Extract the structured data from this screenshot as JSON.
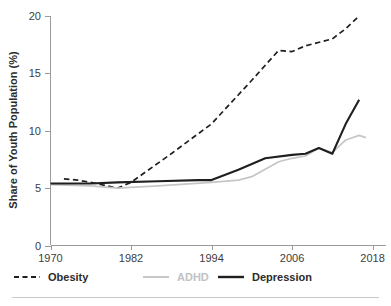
{
  "chart_data": {
    "type": "line",
    "title": "",
    "xlabel": "",
    "ylabel": "Share of Youth Population (%)",
    "xlim": [
      1970,
      2020
    ],
    "ylim": [
      0,
      20
    ],
    "xticks": [
      1970,
      1982,
      1994,
      2006,
      2018
    ],
    "xticklabels": [
      "1970",
      "1982",
      "1994",
      "2006",
      "2018"
    ],
    "yticks": [
      0,
      5,
      10,
      15,
      20
    ],
    "yticklabels": [
      "0",
      "5",
      "10",
      "15",
      "20"
    ],
    "grid": false,
    "legend_position": "below-axes",
    "series": [
      {
        "name": "Obesity",
        "color": "#1f1f1f",
        "style": "dashed",
        "width": 1.7,
        "x": [
          1972,
          1974,
          1976,
          1980,
          1982,
          1988,
          1994,
          2000,
          2004,
          2006,
          2008,
          2012,
          2014,
          2016
        ],
        "values": [
          5.8,
          5.7,
          5.5,
          5.0,
          5.5,
          8.0,
          10.6,
          14.4,
          17.0,
          16.9,
          17.4,
          18.0,
          18.9,
          20.0
        ]
      },
      {
        "name": "ADHD",
        "color": "#c6c6c6",
        "style": "solid",
        "width": 1.7,
        "x": [
          1970,
          1976,
          1980,
          1986,
          1994,
          1998,
          2000,
          2004,
          2006,
          2008,
          2010,
          2012,
          2014,
          2016,
          2017
        ],
        "values": [
          5.3,
          5.2,
          5.0,
          5.2,
          5.5,
          5.7,
          6.0,
          7.3,
          7.6,
          7.8,
          8.5,
          8.1,
          9.2,
          9.6,
          9.4
        ]
      },
      {
        "name": "Depression",
        "color": "#1f1f1f",
        "style": "solid",
        "width": 2.1,
        "x": [
          1970,
          1976,
          1980,
          1986,
          1992,
          1994,
          1998,
          2002,
          2006,
          2008,
          2010,
          2012,
          2014,
          2016
        ],
        "values": [
          5.4,
          5.4,
          5.5,
          5.6,
          5.7,
          5.7,
          6.6,
          7.6,
          7.9,
          8.0,
          8.5,
          8.0,
          10.6,
          12.7
        ]
      }
    ]
  },
  "legend": {
    "items": [
      {
        "label": "Obesity",
        "color": "#1f1f1f",
        "style": "dashed",
        "text_color": "#2b2b2b"
      },
      {
        "label": "ADHD",
        "color": "#c6c6c6",
        "style": "solid",
        "text_color": "#c2c2c2"
      },
      {
        "label": "Depression",
        "color": "#1f1f1f",
        "style": "solid",
        "text_color": "#2b2b2b"
      }
    ]
  },
  "colors": {
    "axis": "#9a9a9a",
    "text": "#3d3d3d",
    "obesity": "#1f1f1f",
    "adhd": "#c6c6c6",
    "depression": "#1f1f1f",
    "footer_rule": "#c9c9c9",
    "background": "#ffffff"
  }
}
